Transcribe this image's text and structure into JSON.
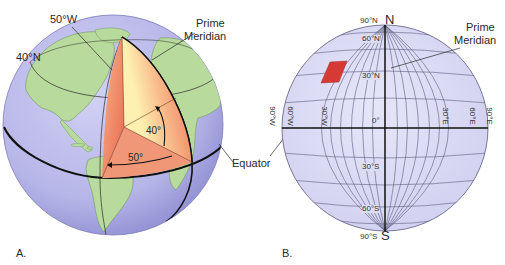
{
  "figure": {
    "panel_a": {
      "letter": "A.",
      "labels": {
        "lon_50w": "50°W",
        "lat_40n": "40°N",
        "prime_meridian_line1": "Prime",
        "prime_meridian_line2": "Meridian",
        "angle_40": "40°",
        "angle_50": "50°",
        "equator": "Equator"
      },
      "colors": {
        "ocean": "#b9b8ea",
        "land": "#b5d99a",
        "wedge_outer": "#ee7a5e",
        "wedge_inner": "#fde9a8",
        "grid_line": "#222222"
      }
    },
    "panel_b": {
      "letter": "B.",
      "labels": {
        "north": "N",
        "south": "S",
        "lat_90n": "90°N",
        "lat_60n": "60°N",
        "lat_30n": "30°N",
        "lat_0": "0°",
        "lat_30s": "30°S",
        "lat_60s": "60°S",
        "lat_90s": "90°S",
        "lon_90w": "90°W",
        "lon_60w": "60°W",
        "lon_30w": "30°W",
        "lon_30e": "30°E",
        "lon_60e": "60°E",
        "lon_90e": "90°E",
        "prime_meridian_line1": "Prime",
        "prime_meridian_line2": "Meridian"
      },
      "colors": {
        "globe_fill": "#dcdcf5",
        "grid_line": "#555577",
        "highlight_cell": "#d63a35"
      }
    }
  }
}
